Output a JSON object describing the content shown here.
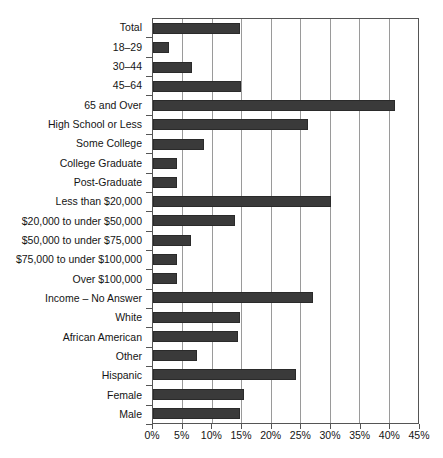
{
  "chart_data": {
    "type": "bar",
    "orientation": "horizontal",
    "title": "",
    "subtitle": "",
    "xlabel": "",
    "ylabel": "",
    "xlim": [
      0,
      45
    ],
    "xtick_values": [
      0,
      5,
      10,
      15,
      20,
      25,
      30,
      35,
      40,
      45
    ],
    "xtick_labels": [
      "0%",
      "5%",
      "10%",
      "15%",
      "20%",
      "25%",
      "30%",
      "35%",
      "40%",
      "45%"
    ],
    "grid": "vertical",
    "legend": "none",
    "bar_color": "#3a3a3a",
    "categories": [
      "Total",
      "18–29",
      "30–44",
      "45–64",
      "65 and Over",
      "High School or Less",
      "Some College",
      "College Graduate",
      "Post-Graduate",
      "Less than $20,000",
      "$20,000 to under $50,000",
      "$50,000 to under $75,000",
      "$75,000 to under $100,000",
      "Over $100,000",
      "Income – No Answer",
      "White",
      "African American",
      "Other",
      "Hispanic",
      "Female",
      "Male"
    ],
    "values": [
      14.8,
      2.7,
      6.6,
      14.9,
      41.1,
      26.3,
      8.6,
      4.0,
      4.0,
      30.2,
      14.0,
      6.5,
      4.0,
      4.0,
      27.2,
      14.7,
      14.5,
      7.4,
      24.3,
      15.5,
      14.8
    ],
    "value_labels": [
      "14.8%",
      "2.7%",
      "6.6%",
      "14.9%",
      "41.1%",
      "26.3%",
      "8.6%",
      "4.0%",
      "4.0%",
      "30.2%",
      "14.0%",
      "6.5%",
      "4.0%",
      "4.0%",
      "27.2%",
      "14.7%",
      "14.5%",
      "7.4%",
      "24.3%",
      "15.5%",
      "14.8%"
    ]
  },
  "footer": {
    "note": ""
  }
}
